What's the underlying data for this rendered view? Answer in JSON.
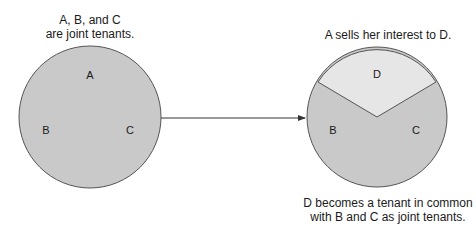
{
  "diagram": {
    "before": {
      "caption_line1": "A, B, and C",
      "caption_line2": "are joint tenants.",
      "labels": {
        "a": "A",
        "b": "B",
        "c": "C"
      },
      "fill": "#c9c9c9"
    },
    "after": {
      "caption_top": "A sells her interest to D.",
      "caption_bottom_line1": "D becomes a tenant in common",
      "caption_bottom_line2": "with B and C as joint tenants.",
      "labels": {
        "d": "D",
        "b": "B",
        "c": "C"
      },
      "fill_joint": "#c9c9c9",
      "fill_d": "#e6e6e6"
    },
    "stroke": "#555555"
  }
}
